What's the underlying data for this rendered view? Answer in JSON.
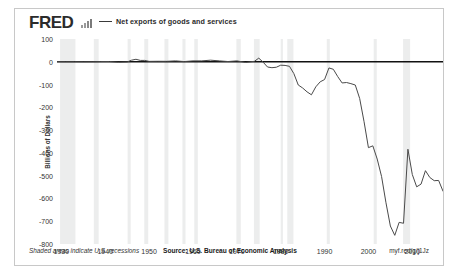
{
  "header": {
    "logo_text": "FRED",
    "logo_mark_icon": "bar-chart-icon",
    "legend_label": "Net exports of goods and services"
  },
  "footer": {
    "recession_note": "Shaded areas indicate U.S. recessions",
    "source_note": "Source: U.S. Bureau of Economic Analysis",
    "short_url": "myf.red/g/j1Jz"
  },
  "colors": {
    "line": "#4a4a4a",
    "zero_line": "#111111",
    "recession_band": "#eceded",
    "frame_border": "#c8c8c8",
    "text": "#333333"
  },
  "chart_data": {
    "type": "line",
    "title": "",
    "subtitle": "",
    "xlabel": "",
    "ylabel": "Billions of Dollars",
    "xlim": [
      1929,
      2017
    ],
    "ylim": [
      -800,
      100
    ],
    "ytick_labels": [
      "100",
      "0",
      "-100",
      "-200",
      "-300",
      "-400",
      "-500",
      "-600",
      "-700",
      "-800"
    ],
    "ytick_values": [
      100,
      0,
      -100,
      -200,
      -300,
      -400,
      -500,
      -600,
      -700,
      -800
    ],
    "xtick_labels": [
      "1930",
      "1940",
      "1950",
      "1960",
      "1970",
      "1980",
      "1990",
      "2000",
      "2010"
    ],
    "xtick_values": [
      1930,
      1940,
      1950,
      1960,
      1970,
      1980,
      1990,
      2000,
      2010
    ],
    "grid": false,
    "legend_position": "top-left",
    "zero_reference_line": 0,
    "series": [
      {
        "name": "Net exports of goods and services",
        "x": [
          1929,
          1931,
          1933,
          1935,
          1937,
          1939,
          1941,
          1943,
          1945,
          1946,
          1947,
          1948,
          1949,
          1950,
          1952,
          1954,
          1956,
          1958,
          1960,
          1962,
          1964,
          1966,
          1968,
          1970,
          1972,
          1974,
          1975,
          1976,
          1977,
          1978,
          1979,
          1980,
          1981,
          1982,
          1983,
          1984,
          1985,
          1986,
          1987,
          1988,
          1989,
          1990,
          1991,
          1992,
          1993,
          1994,
          1995,
          1996,
          1997,
          1998,
          1999,
          2000,
          2001,
          2002,
          2003,
          2004,
          2005,
          2006,
          2007,
          2008,
          2009,
          2010,
          2011,
          2012,
          2013,
          2014,
          2015,
          2016,
          2017
        ],
        "values": [
          0.4,
          0.2,
          0.2,
          -0.2,
          0.1,
          0.8,
          1.0,
          -2.2,
          -0.8,
          7.0,
          11.0,
          6.0,
          6.0,
          1.8,
          2.2,
          2.0,
          4.0,
          1.0,
          4.0,
          4.0,
          7.0,
          4.0,
          1.0,
          4.0,
          -3.0,
          2.0,
          16.0,
          -2.0,
          -23.0,
          -26.0,
          -24.0,
          -15.0,
          -16.0,
          -20.0,
          -52.0,
          -102.0,
          -115.0,
          -132.0,
          -145.0,
          -110.0,
          -88.0,
          -78.0,
          -27.0,
          -33.0,
          -65.0,
          -93.0,
          -91.0,
          -96.0,
          -102.0,
          -161.0,
          -263.0,
          -377.0,
          -369.0,
          -427.0,
          -504.0,
          -619.0,
          -721.0,
          -762.0,
          -705.0,
          -709.0,
          -384.0,
          -495.0,
          -549.0,
          -537.0,
          -478.0,
          -508.0,
          -522.0,
          -521.0,
          -568.0
        ]
      }
    ],
    "recession_bands": [
      [
        1929.7,
        1933.2
      ],
      [
        1937.4,
        1938.5
      ],
      [
        1945.1,
        1945.8
      ],
      [
        1948.9,
        1949.8
      ],
      [
        1953.5,
        1954.4
      ],
      [
        1957.6,
        1958.3
      ],
      [
        1960.3,
        1961.1
      ],
      [
        1969.9,
        1970.9
      ],
      [
        1973.9,
        1975.2
      ],
      [
        1980.0,
        1980.5
      ],
      [
        1981.5,
        1982.9
      ],
      [
        1990.5,
        1991.2
      ],
      [
        2001.2,
        2001.9
      ],
      [
        2007.9,
        2009.5
      ]
    ]
  }
}
